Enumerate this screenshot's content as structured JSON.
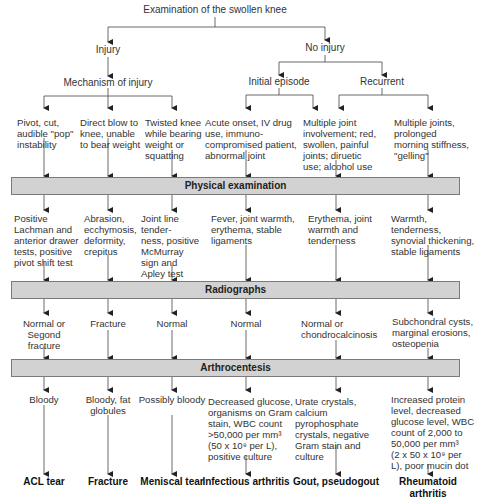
{
  "title": "Examination of the swollen knee",
  "branches": {
    "injury": "Injury",
    "no_injury": "No injury",
    "mechanism": "Mechanism of injury",
    "initial": "Initial episode",
    "recurrent": "Recurrent"
  },
  "history": [
    "Pivot, cut,\naudible \"pop\"\ninstability",
    "Direct blow to\nknee, unable\nto bear weight",
    "Twisted knee\nwhile bearing\nweight or\nsquatting",
    "Acute onset, IV drug\nuse, immuno-\ncompromised patient,\nabnormal joint",
    "Multiple joint\ninvolvement; red,\nswollen, painful\njoints; diruetic\nuse; alcohol use",
    "Multiple joints,\nprolonged\nmorning stiffness,\n\"gelling\""
  ],
  "bands": {
    "physical": "Physical examination",
    "radiographs": "Radiographs",
    "arthrocentesis": "Arthrocentesis"
  },
  "physical_findings": [
    "Positive\nLachman and\nanterior drawer\ntests, positive\npivot shift test",
    "Abrasion,\necchymosis,\ndeformity,\ncrepitus",
    "Joint line tender-\nness, positive\nMcMurray\nsign and\nApley test",
    "Fever, joint warmth,\nerythema, stable\nligaments",
    "Erythema, joint\nwarmth and\ntenderness",
    "Warmth, tenderness,\nsynovial thickening,\nstable ligaments"
  ],
  "radiograph_findings": [
    "Normal or\nSegond\nfracture",
    "Fracture",
    "Normal",
    "Normal",
    "Normal or\nchondrocalcinosis",
    "Subchondral cysts,\nmarginal erosions,\nosteopenia"
  ],
  "arthrocentesis_findings": [
    "Bloody",
    "Bloody, fat\nglobules",
    "Possibly bloody",
    "Decreased glucose,\norganisms on Gram\nstain, WBC count\n>50,000 per mm³\n(50 x 10⁹ per L),\npositive culture",
    "Urate crystals, calcium\npyrophosphate\ncrystals, negative\nGram stain and\nculture",
    "Increased protein\nlevel, decreased\nglucose level, WBC\ncount of 2,000 to\n50,000 per mm³\n(2 x 50 x 10⁹ per\nL), poor mucin dot"
  ],
  "diagnoses": [
    "ACL tear",
    "Fracture",
    "Meniscal tear",
    "Infectious arthritis",
    "Gout, pseudogout",
    "Rheumatoid\narthritis"
  ],
  "colors": {
    "band_fill": "#d2d2d2",
    "band_border": "#7a7a7a",
    "line": "#333333"
  }
}
